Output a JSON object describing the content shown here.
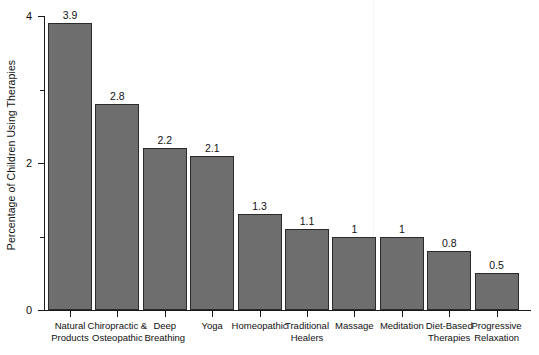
{
  "chart_data": {
    "type": "bar",
    "title": "",
    "xlabel": "",
    "ylabel": "Percentage of Children Using Therapies",
    "ylim": [
      0,
      4
    ],
    "y_ticks": [
      0,
      2,
      4
    ],
    "y_tick_labels": [
      "0",
      "2",
      "4"
    ],
    "y_minor_ticks": [
      1,
      3
    ],
    "grid": false,
    "legend": null,
    "bar_color": "#6e6e6e",
    "bar_edge_color": "#2b2b2b",
    "axis_color": "#1a1a1a",
    "categories": [
      "Natural Products",
      "Chiropractic & Osteopathic",
      "Deep Breathing",
      "Yoga",
      "Homeopathic",
      "Traditional Healers",
      "Massage",
      "Meditation",
      "Diet-Based Therapies",
      "Progressive Relaxation"
    ],
    "category_lines": [
      [
        "Natural",
        "Products"
      ],
      [
        "Chiropractic &",
        "Osteopathic"
      ],
      [
        "Deep",
        "Breathing"
      ],
      [
        "Yoga",
        ""
      ],
      [
        "Homeopathic",
        ""
      ],
      [
        "Traditional",
        "Healers"
      ],
      [
        "Massage",
        ""
      ],
      [
        "Meditation",
        ""
      ],
      [
        "Diet-Based",
        "Therapies"
      ],
      [
        "Progressive",
        "Relaxation"
      ]
    ],
    "values": [
      3.9,
      2.8,
      2.2,
      2.1,
      1.3,
      1.1,
      1,
      1,
      0.8,
      0.5
    ],
    "value_labels": [
      "3.9",
      "2.8",
      "2.2",
      "2.1",
      "1.3",
      "1.1",
      "1",
      "1",
      "0.8",
      "0.5"
    ]
  }
}
